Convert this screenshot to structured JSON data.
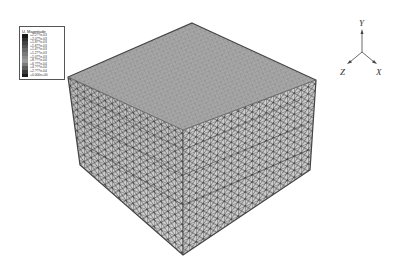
{
  "legend": {
    "title": "U, Magnitude",
    "entries": [
      {
        "label": "+2.2??e-03",
        "color": "#1a1a1a"
      },
      {
        "label": "+2.0??e-03",
        "color": "#2e2e2e"
      },
      {
        "label": "+1.8??e-03",
        "color": "#424242"
      },
      {
        "label": "+1.6??e-03",
        "color": "#555555"
      },
      {
        "label": "+1.4??e-03",
        "color": "#686868"
      },
      {
        "label": "+1.2??e-03",
        "color": "#7a7a7a"
      },
      {
        "label": "+1.0??e-03",
        "color": "#8c8c8c"
      },
      {
        "label": "+8.???e-04",
        "color": "#9a9a9a"
      },
      {
        "label": "+6.???e-04",
        "color": "#7c7c7c"
      },
      {
        "label": "+4.???e-04",
        "color": "#5c5c5c"
      },
      {
        "label": "+2.???e-04",
        "color": "#3c3c3c"
      },
      {
        "label": "+0.000e+00",
        "color": "#1e1e1e"
      }
    ]
  },
  "triad": {
    "y": "Y",
    "z": "Z",
    "x": "X"
  },
  "model": {
    "description": "space frame lattice cube, deformed shape contour"
  }
}
